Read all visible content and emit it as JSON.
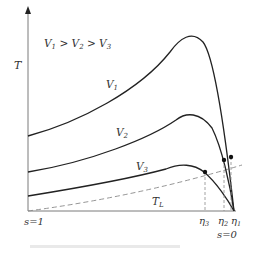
{
  "diagram": {
    "y_axis_label": "T",
    "legend_text": "V",
    "legend": {
      "v1": "V",
      "v1_sub": "1",
      "gt1": " > ",
      "v2": "V",
      "v2_sub": "2",
      "gt2": " > ",
      "v3": "V",
      "v3_sub": "3"
    },
    "curves": [
      {
        "name": "V1",
        "label": "V",
        "sub": "1",
        "style": "solid"
      },
      {
        "name": "V2",
        "label": "V",
        "sub": "2",
        "style": "solid"
      },
      {
        "name": "V3",
        "label": "V",
        "sub": "3",
        "style": "solid"
      },
      {
        "name": "TL",
        "label": "T",
        "sub": "L",
        "style": "dashed"
      }
    ],
    "x_left_label": "s=1",
    "x_right_label": "s=0",
    "eta_labels": [
      {
        "sym": "η",
        "sub": "3"
      },
      {
        "sym": "η",
        "sub": "2"
      },
      {
        "sym": "η",
        "sub": "1"
      }
    ],
    "colors": {
      "axis": "#7a7a7a",
      "curve": "#222222",
      "dashed": "#8a8a8a",
      "text": "#333333"
    }
  }
}
